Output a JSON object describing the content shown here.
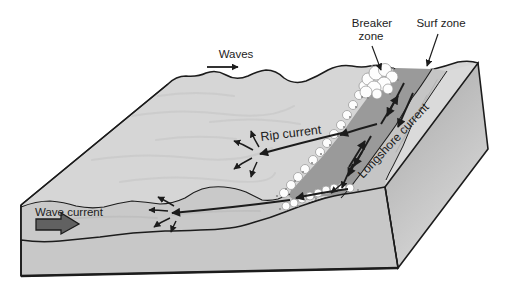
{
  "diagram": {
    "type": "3d-block-diagram",
    "labels": {
      "waves": "Waves",
      "breaker_zone_line1": "Breaker",
      "breaker_zone_line2": "zone",
      "surf_zone": "Surf zone",
      "rip_current": "Rip current",
      "longshore_current": "Longshore current",
      "wave_current": "Wave current"
    },
    "colors": {
      "outline": "#1c1c1c",
      "label_text": "#1d1d1d",
      "water_upper": "#d6d6d6",
      "water_lower": "#c9c9c9",
      "front_face": "#c8c8c8",
      "side_face_top": "#a6a6a6",
      "side_face_bottom": "#d8d8d8",
      "swash_band": "#9a9a9a",
      "beach_wet": "#c5c5c5",
      "beach_dry": "#dadada",
      "foam": "#fdfdfd",
      "foam_edge": "#9c9c9c",
      "wave_current_arrow": "#616161",
      "background": "#ffffff"
    }
  }
}
